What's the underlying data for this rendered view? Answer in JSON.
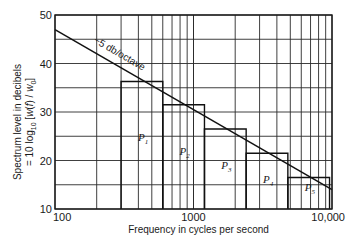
{
  "chart_data": {
    "type": "bar",
    "title": "",
    "xlabel": "Frequency in cycles per second",
    "ylabel_line1": "Spectrum level in decibels",
    "ylabel_line2": "= 10 log10 [w(f)/w0]",
    "xscale": "log",
    "xlim": [
      100,
      10000
    ],
    "ylim": [
      10,
      50
    ],
    "x_ticks": [
      {
        "value": 100,
        "label": "100"
      },
      {
        "value": 1000,
        "label": "1000"
      },
      {
        "value": 10000,
        "label": "10,000"
      }
    ],
    "y_ticks": [
      {
        "value": 10,
        "label": "10"
      },
      {
        "value": 20,
        "label": "20"
      },
      {
        "value": 30,
        "label": "30"
      },
      {
        "value": 40,
        "label": "40"
      },
      {
        "value": 50,
        "label": "50"
      }
    ],
    "grid": true,
    "y_grid_step": 5,
    "bands": [
      {
        "label": "P",
        "sub": "1",
        "f_low": 300,
        "f_high": 600,
        "level": 36.3
      },
      {
        "label": "P",
        "sub": "2",
        "f_low": 600,
        "f_high": 1200,
        "level": 31.5
      },
      {
        "label": "P",
        "sub": "3",
        "f_low": 1200,
        "f_high": 2400,
        "level": 26.5
      },
      {
        "label": "P",
        "sub": "4",
        "f_low": 2400,
        "f_high": 4800,
        "level": 21.5
      },
      {
        "label": "P",
        "sub": "5",
        "f_low": 4800,
        "f_high": 9600,
        "level": 16.5
      }
    ],
    "trend_line": {
      "label": "−5 db/octave",
      "x": [
        100,
        10000
      ],
      "y": [
        47,
        14
      ]
    }
  }
}
